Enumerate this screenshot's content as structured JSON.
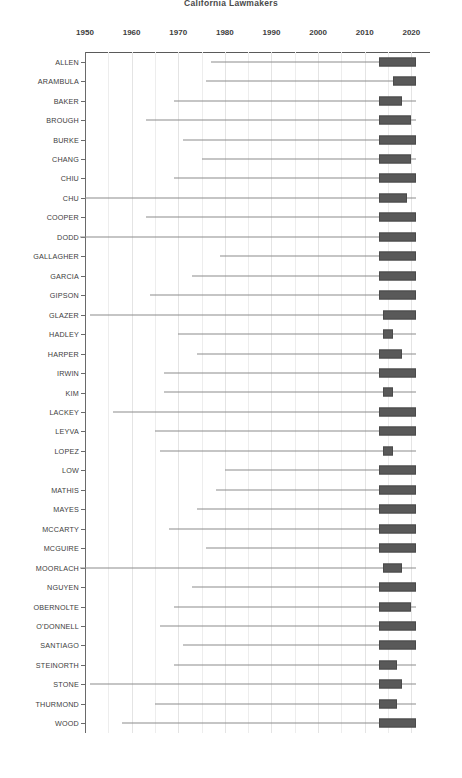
{
  "chart_data": {
    "type": "box",
    "title": "California Lawmakers",
    "xlabel": "",
    "ylabel": "",
    "xlim": [
      1950,
      2024
    ],
    "x_tick_labels": [
      "1950",
      "1960",
      "1970",
      "1980",
      "1990",
      "2000",
      "2010",
      "2020"
    ],
    "x_major_ticks": [
      1950,
      1960,
      1970,
      1980,
      1990,
      2000,
      2010,
      2020
    ],
    "x_minor_ticks": [
      1955,
      1965,
      1975,
      1985,
      1995,
      2005,
      2015
    ],
    "grid": "vertical-light",
    "legend": "none",
    "orientation": "horizontal",
    "categories": [
      "ALLEN",
      "ARAMBULA",
      "BAKER",
      "BROUGH",
      "BURKE",
      "CHANG",
      "CHIU",
      "CHU",
      "COOPER",
      "DODD",
      "GALLAGHER",
      "GARCIA",
      "GIPSON",
      "GLAZER",
      "HADLEY",
      "HARPER",
      "IRWIN",
      "KIM",
      "LACKEY",
      "LEYVA",
      "LOPEZ",
      "LOW",
      "MATHIS",
      "MAYES",
      "MCCARTY",
      "MCGUIRE",
      "MOORLACH",
      "NGUYEN",
      "OBERNOLTE",
      "O'DONNELL",
      "SANTIAGO",
      "STEINORTH",
      "STONE",
      "THURMOND",
      "WOOD"
    ],
    "boxes": [
      {
        "name": "ALLEN",
        "whisker_low": 1977,
        "box_low": 2013,
        "box_high": 2021,
        "whisker_high": 2021
      },
      {
        "name": "ARAMBULA",
        "whisker_low": 1976,
        "box_low": 2016,
        "box_high": 2021,
        "whisker_high": 2021
      },
      {
        "name": "BAKER",
        "whisker_low": 1969,
        "box_low": 2013,
        "box_high": 2018,
        "whisker_high": 2021
      },
      {
        "name": "BROUGH",
        "whisker_low": 1963,
        "box_low": 2013,
        "box_high": 2020,
        "whisker_high": 2021
      },
      {
        "name": "BURKE",
        "whisker_low": 1971,
        "box_low": 2013,
        "box_high": 2021,
        "whisker_high": 2021
      },
      {
        "name": "CHANG",
        "whisker_low": 1975,
        "box_low": 2013,
        "box_high": 2020,
        "whisker_high": 2021
      },
      {
        "name": "CHIU",
        "whisker_low": 1969,
        "box_low": 2013,
        "box_high": 2021,
        "whisker_high": 2021
      },
      {
        "name": "CHU",
        "whisker_low": 1950,
        "box_low": 2013,
        "box_high": 2019,
        "whisker_high": 2021
      },
      {
        "name": "COOPER",
        "whisker_low": 1963,
        "box_low": 2013,
        "box_high": 2021,
        "whisker_high": 2021
      },
      {
        "name": "DODD",
        "whisker_low": 1949,
        "box_low": 2013,
        "box_high": 2021,
        "whisker_high": 2021
      },
      {
        "name": "GALLAGHER",
        "whisker_low": 1979,
        "box_low": 2013,
        "box_high": 2021,
        "whisker_high": 2021
      },
      {
        "name": "GARCIA",
        "whisker_low": 1973,
        "box_low": 2013,
        "box_high": 2021,
        "whisker_high": 2021
      },
      {
        "name": "GIPSON",
        "whisker_low": 1964,
        "box_low": 2013,
        "box_high": 2021,
        "whisker_high": 2021
      },
      {
        "name": "GLAZER",
        "whisker_low": 1951,
        "box_low": 2014,
        "box_high": 2021,
        "whisker_high": 2021
      },
      {
        "name": "HADLEY",
        "whisker_low": 1970,
        "box_low": 2014,
        "box_high": 2016,
        "whisker_high": 2021
      },
      {
        "name": "HARPER",
        "whisker_low": 1974,
        "box_low": 2013,
        "box_high": 2018,
        "whisker_high": 2021
      },
      {
        "name": "IRWIN",
        "whisker_low": 1967,
        "box_low": 2013,
        "box_high": 2021,
        "whisker_high": 2021
      },
      {
        "name": "KIM",
        "whisker_low": 1967,
        "box_low": 2014,
        "box_high": 2016,
        "whisker_high": 2021
      },
      {
        "name": "LACKEY",
        "whisker_low": 1956,
        "box_low": 2013,
        "box_high": 2021,
        "whisker_high": 2021
      },
      {
        "name": "LEYVA",
        "whisker_low": 1965,
        "box_low": 2013,
        "box_high": 2021,
        "whisker_high": 2021
      },
      {
        "name": "LOPEZ",
        "whisker_low": 1966,
        "box_low": 2014,
        "box_high": 2016,
        "whisker_high": 2021
      },
      {
        "name": "LOW",
        "whisker_low": 1980,
        "box_low": 2013,
        "box_high": 2021,
        "whisker_high": 2021
      },
      {
        "name": "MATHIS",
        "whisker_low": 1978,
        "box_low": 2013,
        "box_high": 2021,
        "whisker_high": 2021
      },
      {
        "name": "MAYES",
        "whisker_low": 1974,
        "box_low": 2013,
        "box_high": 2021,
        "whisker_high": 2021
      },
      {
        "name": "MCCARTY",
        "whisker_low": 1968,
        "box_low": 2013,
        "box_high": 2021,
        "whisker_high": 2021
      },
      {
        "name": "MCGUIRE",
        "whisker_low": 1976,
        "box_low": 2013,
        "box_high": 2021,
        "whisker_high": 2021
      },
      {
        "name": "MOORLACH",
        "whisker_low": 1949,
        "box_low": 2014,
        "box_high": 2018,
        "whisker_high": 2021
      },
      {
        "name": "NGUYEN",
        "whisker_low": 1973,
        "box_low": 2013,
        "box_high": 2021,
        "whisker_high": 2021
      },
      {
        "name": "OBERNOLTE",
        "whisker_low": 1969,
        "box_low": 2013,
        "box_high": 2020,
        "whisker_high": 2021
      },
      {
        "name": "O'DONNELL",
        "whisker_low": 1966,
        "box_low": 2013,
        "box_high": 2021,
        "whisker_high": 2021
      },
      {
        "name": "SANTIAGO",
        "whisker_low": 1971,
        "box_low": 2013,
        "box_high": 2021,
        "whisker_high": 2021
      },
      {
        "name": "STEINORTH",
        "whisker_low": 1969,
        "box_low": 2013,
        "box_high": 2017,
        "whisker_high": 2021
      },
      {
        "name": "STONE",
        "whisker_low": 1951,
        "box_low": 2013,
        "box_high": 2018,
        "whisker_high": 2021
      },
      {
        "name": "THURMOND",
        "whisker_low": 1965,
        "box_low": 2013,
        "box_high": 2017,
        "whisker_high": 2021
      },
      {
        "name": "WOOD",
        "whisker_low": 1958,
        "box_low": 2013,
        "box_high": 2021,
        "whisker_high": 2021
      }
    ],
    "colors": {
      "box_fill": "#595959",
      "box_edge": "#4a4a4a",
      "whisker": "#8c8c8c",
      "grid": "#ededed",
      "axis": "#5a5a5a",
      "text": "#3d3d3d",
      "background": "#ffffff"
    }
  }
}
